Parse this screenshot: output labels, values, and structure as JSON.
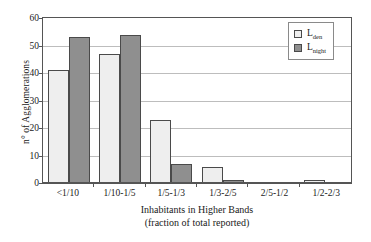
{
  "chart_data": {
    "type": "bar",
    "title": "",
    "xlabel": "Inhabitants in Higher Bands",
    "xlabel_line2": "(fraction of total reported)",
    "ylabel": "n° of Agglomerations",
    "categories": [
      "<1/10",
      "1/10-1/5",
      "1/5-1/3",
      "1/3-2/5",
      "2/5-1/2",
      "1/2-2/3"
    ],
    "series": [
      {
        "name": "Lden",
        "name_base": "L",
        "name_sub": "den",
        "color": "#eeeeee",
        "values": [
          41,
          47,
          23,
          6,
          0,
          1
        ]
      },
      {
        "name": "Lnight",
        "name_base": "L",
        "name_sub": "night",
        "color": "#8f8f8f",
        "values": [
          53,
          54,
          7,
          1,
          0,
          0
        ]
      }
    ],
    "ylim": [
      0,
      60
    ],
    "yticks": [
      0,
      10,
      20,
      30,
      40,
      50,
      60
    ],
    "ytick_labels": [
      "0",
      "10",
      "20",
      "30",
      "40",
      "50",
      "60"
    ],
    "grid": true,
    "grid_axis": "y",
    "legend_position": "top-right",
    "bar_border_color": "#4a4a4a",
    "axis_color": "#555555",
    "gridline_color": "#bdbdbd",
    "background": "#ffffff"
  },
  "legend": {
    "entries": [
      {
        "base": "L",
        "sub": "den"
      },
      {
        "base": "L",
        "sub": "night"
      }
    ]
  }
}
